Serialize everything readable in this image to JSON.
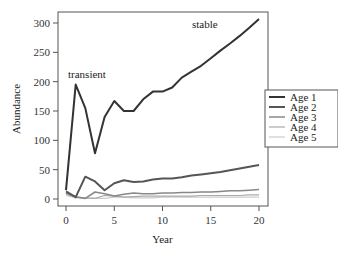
{
  "chart_data": {
    "type": "line",
    "title": "",
    "xlabel": "Year",
    "ylabel": "Abundance",
    "xlim": [
      0,
      20
    ],
    "ylim": [
      0,
      300
    ],
    "xticks": [
      0,
      5,
      10,
      15,
      20
    ],
    "yticks": [
      0,
      50,
      100,
      150,
      200,
      250,
      300
    ],
    "grid": false,
    "legend_position": "right",
    "annotations": [
      {
        "text": "transient",
        "x": 2,
        "y": 205
      },
      {
        "text": "stable",
        "x": 14,
        "y": 300
      }
    ],
    "x": [
      0,
      1,
      2,
      3,
      4,
      5,
      6,
      7,
      8,
      9,
      10,
      11,
      12,
      13,
      14,
      15,
      16,
      17,
      18,
      19,
      20
    ],
    "series": [
      {
        "name": "Age 1",
        "color": "#333333",
        "width": 2,
        "values": [
          15,
          195,
          155,
          78,
          140,
          167,
          150,
          150,
          170,
          183,
          183,
          190,
          207,
          217,
          227,
          240,
          253,
          265,
          278,
          292,
          307
        ]
      },
      {
        "name": "Age 2",
        "color": "#555555",
        "width": 2,
        "values": [
          13,
          3,
          38,
          30,
          15,
          27,
          32,
          29,
          30,
          33,
          35,
          35,
          37,
          40,
          42,
          44,
          46,
          49,
          52,
          55,
          58
        ]
      },
      {
        "name": "Age 3",
        "color": "#888888",
        "width": 1.5,
        "values": [
          10,
          4,
          1,
          12,
          9,
          5,
          8,
          10,
          9,
          9,
          10,
          10,
          11,
          11,
          12,
          12,
          13,
          14,
          14,
          15,
          16
        ]
      },
      {
        "name": "Age 4",
        "color": "#aaaaaa",
        "width": 1.2,
        "values": [
          8,
          3,
          2,
          1,
          6,
          5,
          3,
          4,
          5,
          5,
          5,
          5,
          5,
          5,
          6,
          6,
          6,
          6,
          6,
          7,
          7
        ]
      },
      {
        "name": "Age 5",
        "color": "#cccccc",
        "width": 1.2,
        "values": [
          6,
          2,
          1,
          1,
          1,
          3,
          3,
          2,
          2,
          2,
          3,
          3,
          3,
          3,
          3,
          3,
          3,
          3,
          3,
          3,
          3
        ]
      }
    ]
  }
}
